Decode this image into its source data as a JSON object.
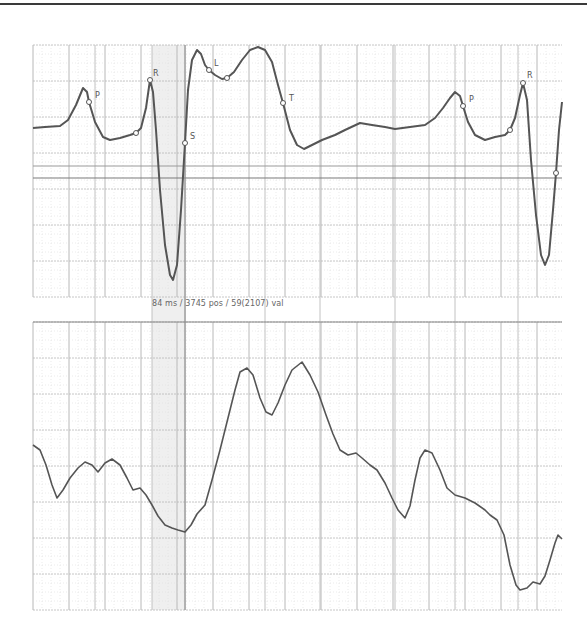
{
  "chart_data": [
    {
      "type": "line",
      "title": "ECG beat (annotated)",
      "xlabel": "",
      "ylabel": "",
      "grid": true,
      "legend": null,
      "annotations": [
        {
          "label": "P",
          "x": 89,
          "y": 102,
          "label_dx": 6,
          "label_dy": -4
        },
        {
          "label": "",
          "x": 136,
          "y": 133,
          "label_dx": 0,
          "label_dy": 0
        },
        {
          "label": "R",
          "x": 150,
          "y": 80,
          "label_dx": 3,
          "label_dy": -4
        },
        {
          "label": "S",
          "x": 185,
          "y": 143,
          "label_dx": 5,
          "label_dy": -4
        },
        {
          "label": "L",
          "x": 209,
          "y": 70,
          "label_dx": 5,
          "label_dy": -4
        },
        {
          "label": "",
          "x": 227,
          "y": 78,
          "label_dx": 0,
          "label_dy": 0
        },
        {
          "label": "T",
          "x": 283,
          "y": 103,
          "label_dx": 6,
          "label_dy": -2
        },
        {
          "label": "P",
          "x": 463,
          "y": 106,
          "label_dx": 6,
          "label_dy": -4
        },
        {
          "label": "",
          "x": 510,
          "y": 130,
          "label_dx": 0,
          "label_dy": 0
        },
        {
          "label": "R",
          "x": 523,
          "y": 83,
          "label_dx": 4,
          "label_dy": -5
        },
        {
          "label": "",
          "x": 556,
          "y": 173,
          "label_dx": 0,
          "label_dy": 0
        }
      ],
      "points": [
        [
          33,
          128
        ],
        [
          45,
          127
        ],
        [
          60,
          126
        ],
        [
          68,
          120
        ],
        [
          76,
          105
        ],
        [
          83,
          88
        ],
        [
          87,
          92
        ],
        [
          89,
          102
        ],
        [
          95,
          122
        ],
        [
          103,
          137
        ],
        [
          110,
          140
        ],
        [
          120,
          138
        ],
        [
          130,
          135
        ],
        [
          136,
          133
        ],
        [
          141,
          128
        ],
        [
          146,
          108
        ],
        [
          150,
          80
        ],
        [
          153,
          92
        ],
        [
          156,
          130
        ],
        [
          160,
          190
        ],
        [
          165,
          245
        ],
        [
          170,
          275
        ],
        [
          173,
          280
        ],
        [
          177,
          265
        ],
        [
          181,
          210
        ],
        [
          185,
          143
        ],
        [
          188,
          90
        ],
        [
          192,
          60
        ],
        [
          197,
          50
        ],
        [
          201,
          54
        ],
        [
          205,
          65
        ],
        [
          209,
          70
        ],
        [
          215,
          75
        ],
        [
          222,
          79
        ],
        [
          227,
          78
        ],
        [
          234,
          72
        ],
        [
          242,
          60
        ],
        [
          250,
          50
        ],
        [
          258,
          47
        ],
        [
          265,
          50
        ],
        [
          272,
          62
        ],
        [
          278,
          85
        ],
        [
          283,
          103
        ],
        [
          290,
          130
        ],
        [
          297,
          145
        ],
        [
          304,
          149
        ],
        [
          312,
          145
        ],
        [
          322,
          140
        ],
        [
          335,
          135
        ],
        [
          345,
          130
        ],
        [
          360,
          123
        ],
        [
          372,
          125
        ],
        [
          385,
          127
        ],
        [
          395,
          129
        ],
        [
          410,
          127
        ],
        [
          425,
          125
        ],
        [
          435,
          118
        ],
        [
          443,
          108
        ],
        [
          450,
          98
        ],
        [
          455,
          92
        ],
        [
          460,
          96
        ],
        [
          463,
          106
        ],
        [
          468,
          122
        ],
        [
          475,
          135
        ],
        [
          485,
          140
        ],
        [
          495,
          137
        ],
        [
          505,
          135
        ],
        [
          510,
          130
        ],
        [
          515,
          118
        ],
        [
          520,
          95
        ],
        [
          523,
          83
        ],
        [
          527,
          100
        ],
        [
          531,
          160
        ],
        [
          536,
          215
        ],
        [
          541,
          255
        ],
        [
          545,
          265
        ],
        [
          549,
          255
        ],
        [
          553,
          210
        ],
        [
          556,
          173
        ],
        [
          559,
          130
        ],
        [
          562,
          102
        ]
      ]
    },
    {
      "type": "line",
      "title": "Raw signal",
      "xlabel": "",
      "ylabel": "",
      "grid": true,
      "legend": null,
      "points": [
        [
          33,
          445
        ],
        [
          40,
          450
        ],
        [
          46,
          465
        ],
        [
          52,
          485
        ],
        [
          57,
          498
        ],
        [
          63,
          490
        ],
        [
          70,
          478
        ],
        [
          78,
          468
        ],
        [
          85,
          462
        ],
        [
          92,
          465
        ],
        [
          98,
          472
        ],
        [
          105,
          463
        ],
        [
          112,
          459
        ],
        [
          120,
          465
        ],
        [
          127,
          478
        ],
        [
          133,
          490
        ],
        [
          140,
          488
        ],
        [
          146,
          495
        ],
        [
          152,
          505
        ],
        [
          158,
          516
        ],
        [
          165,
          525
        ],
        [
          172,
          528
        ],
        [
          178,
          530
        ],
        [
          185,
          532
        ],
        [
          191,
          525
        ],
        [
          197,
          514
        ],
        [
          205,
          505
        ],
        [
          212,
          480
        ],
        [
          220,
          450
        ],
        [
          228,
          418
        ],
        [
          235,
          390
        ],
        [
          240,
          372
        ],
        [
          247,
          368
        ],
        [
          253,
          375
        ],
        [
          260,
          398
        ],
        [
          266,
          412
        ],
        [
          272,
          415
        ],
        [
          278,
          403
        ],
        [
          285,
          385
        ],
        [
          292,
          370
        ],
        [
          302,
          362
        ],
        [
          310,
          375
        ],
        [
          318,
          392
        ],
        [
          326,
          415
        ],
        [
          333,
          434
        ],
        [
          340,
          450
        ],
        [
          348,
          455
        ],
        [
          356,
          453
        ],
        [
          362,
          458
        ],
        [
          370,
          465
        ],
        [
          377,
          470
        ],
        [
          385,
          483
        ],
        [
          392,
          498
        ],
        [
          398,
          510
        ],
        [
          405,
          518
        ],
        [
          410,
          506
        ],
        [
          415,
          480
        ],
        [
          420,
          458
        ],
        [
          425,
          450
        ],
        [
          432,
          453
        ],
        [
          440,
          470
        ],
        [
          447,
          488
        ],
        [
          455,
          495
        ],
        [
          465,
          498
        ],
        [
          475,
          503
        ],
        [
          485,
          510
        ],
        [
          490,
          515
        ],
        [
          497,
          520
        ],
        [
          504,
          535
        ],
        [
          510,
          565
        ],
        [
          516,
          585
        ],
        [
          520,
          590
        ],
        [
          527,
          588
        ],
        [
          533,
          582
        ],
        [
          540,
          584
        ],
        [
          545,
          576
        ],
        [
          550,
          560
        ],
        [
          555,
          543
        ],
        [
          558,
          535
        ],
        [
          562,
          539
        ]
      ]
    }
  ],
  "readout": {
    "text": "84 ms / 3745 pos / 59(2107) val"
  },
  "colors": {
    "trace": "#555555",
    "grid_major": "#b8b8b8",
    "grid_minor": "#dedede",
    "cursor_band": "#ececec",
    "marker_fill": "#ffffff"
  }
}
